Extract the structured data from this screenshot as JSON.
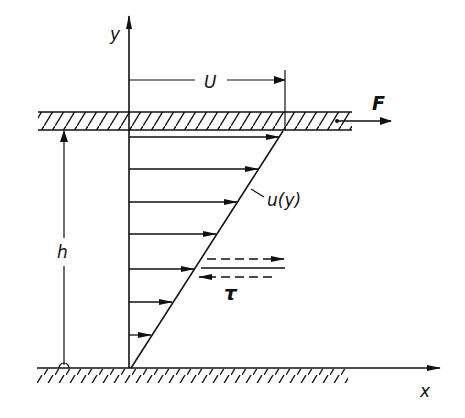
{
  "figure": {
    "labels": {
      "y_axis": "y",
      "x_axis": "x",
      "plate_velocity": "U",
      "force": "F",
      "gap_height": "h",
      "velocity_profile": "u(y)",
      "shear_stress": "τ"
    },
    "colors": {
      "ink": "#111111",
      "background": "#ffffff"
    },
    "elements": {
      "moving_plate": {
        "x_start": 38,
        "x_end": 352,
        "y_top": 112,
        "y_bottom": 130,
        "hatched": true
      },
      "fixed_wall": {
        "x_start": 37,
        "x_end": 348,
        "y_top": 368,
        "hatched": true
      },
      "velocity_arrows_y": [
        137,
        169,
        202,
        234,
        269,
        302,
        335
      ],
      "profile_line": {
        "from": [
          131,
          368
        ],
        "to": [
          283,
          131
        ]
      }
    }
  }
}
